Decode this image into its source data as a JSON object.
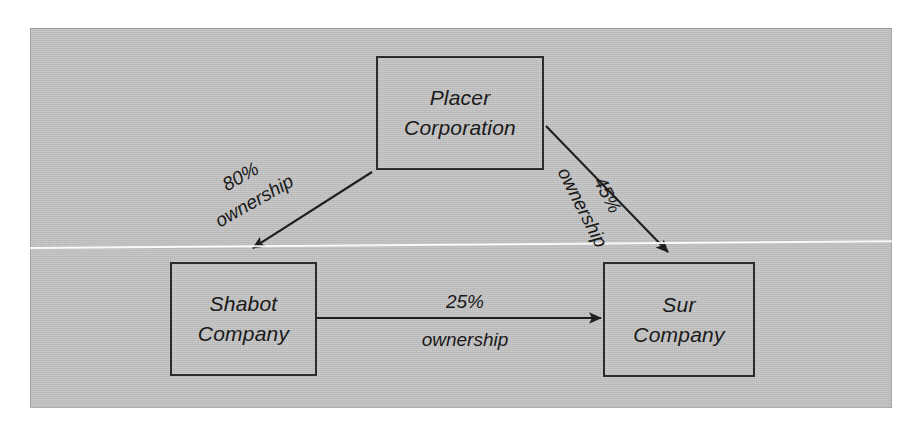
{
  "diagram": {
    "background_color": "#bfbfbf",
    "line_color": "#2b2b2b",
    "nodes": [
      {
        "id": "placer",
        "line1": "Placer",
        "line2": "Corporation"
      },
      {
        "id": "shabot",
        "line1": "Shabot",
        "line2": "Company"
      },
      {
        "id": "sur",
        "line1": "Sur",
        "line2": "Company"
      }
    ],
    "edges": [
      {
        "id": "placer-to-shabot",
        "from": "Placer Corporation",
        "to": "Shabot Company",
        "percent": "80%",
        "relation": "ownership"
      },
      {
        "id": "placer-to-sur",
        "from": "Placer Corporation",
        "to": "Sur Company",
        "percent": "45%",
        "relation": "ownership"
      },
      {
        "id": "shabot-to-sur",
        "from": "Shabot Company",
        "to": "Sur Company",
        "percent": "25%",
        "relation": "ownership"
      }
    ]
  }
}
